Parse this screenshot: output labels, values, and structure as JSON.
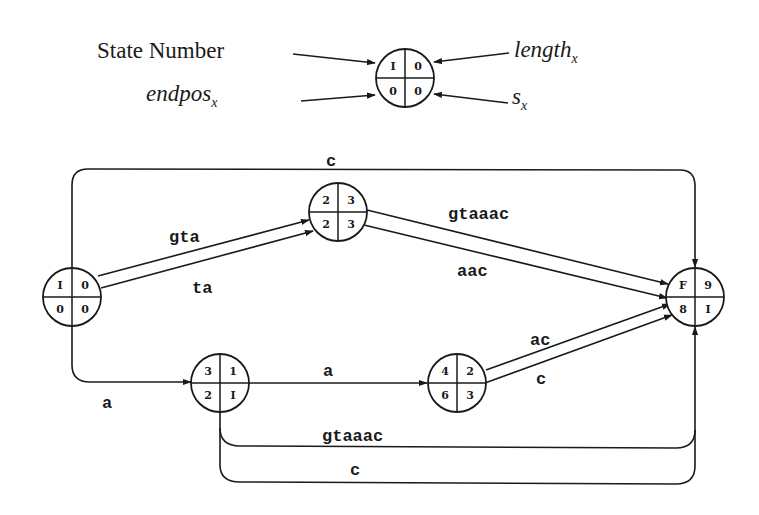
{
  "legend": {
    "state_number_label": "State Number",
    "endpos_label": "endpos",
    "endpos_sub": "x",
    "length_label": "length",
    "length_sub": "x",
    "s_label": "s",
    "s_sub": "x",
    "node": {
      "tl": "I",
      "tr": "0",
      "bl": "0",
      "br": "0"
    }
  },
  "nodes": {
    "I": {
      "tl": "I",
      "tr": "0",
      "bl": "0",
      "br": "0"
    },
    "n2": {
      "tl": "2",
      "tr": "3",
      "bl": "2",
      "br": "3"
    },
    "n3": {
      "tl": "3",
      "tr": "1",
      "bl": "2",
      "br": "I"
    },
    "n4": {
      "tl": "4",
      "tr": "2",
      "bl": "6",
      "br": "3"
    },
    "F": {
      "tl": "F",
      "tr": "9",
      "bl": "8",
      "br": "I"
    }
  },
  "edges": {
    "I_F_top": "c",
    "I_n2_upper": "gta",
    "I_n2_lower": "ta",
    "n2_F_upper": "gtaaac",
    "n2_F_lower": "aac",
    "I_n3": "a",
    "n3_n4": "a",
    "n4_F_upper": "ac",
    "n4_F_lower": "c",
    "n3_F_bottom1": "gtaaac",
    "n3_F_bottom2": "c"
  }
}
